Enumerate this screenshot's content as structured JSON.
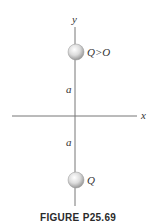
{
  "figure": {
    "caption": "FIGURE P25.69",
    "axes": {
      "x_label": "x",
      "y_label": "y"
    },
    "charges": [
      {
        "label": "Q>O",
        "position": "top",
        "distance_label": "a"
      },
      {
        "label": "Q",
        "position": "bottom",
        "distance_label": "a"
      }
    ],
    "colors": {
      "axis": "#777777",
      "sphere_light": "#f2f2f2",
      "sphere_dark": "#9a9a9a"
    }
  }
}
